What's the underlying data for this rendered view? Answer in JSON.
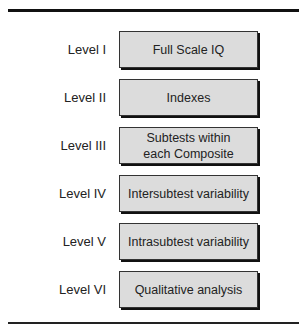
{
  "diagram": {
    "levels": [
      {
        "label": "Level I",
        "box": "Full Scale IQ"
      },
      {
        "label": "Level II",
        "box": "Indexes"
      },
      {
        "label": "Level III",
        "box": "Subtests within each Composite"
      },
      {
        "label": "Level IV",
        "box": "Intersubtest variability"
      },
      {
        "label": "Level V",
        "box": "Intrasubtest variability"
      },
      {
        "label": "Level VI",
        "box": "Qualitative analysis"
      }
    ],
    "colors": {
      "box_fill": "#dcdcdc",
      "border": "#333333",
      "shadow": "#111111",
      "rule": "#111111"
    }
  }
}
